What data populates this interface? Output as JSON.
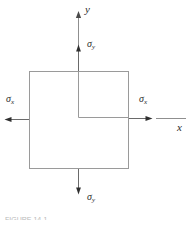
{
  "figure": {
    "kind": "stress-element-diagram",
    "title_caption": "FIGURE 14-1",
    "colors": {
      "element_border": "#9a9a9a",
      "axis_line": "#8f8f8f",
      "arrow": "#4a4a4a",
      "label_text": "#2b2b2b",
      "caption_text": "#b9b9b9",
      "background": "#ffffff"
    },
    "element": {
      "name": "stress-element-square",
      "x": 29,
      "y": 71,
      "width": 99,
      "height": 97
    },
    "origin": {
      "x": 78,
      "y": 117
    }
  },
  "axes": [
    {
      "name": "y-axis",
      "label": "y",
      "label_x": 86,
      "label_y": 6,
      "direction": "up",
      "line": {
        "x1": 78,
        "y1": 117,
        "x2": 78,
        "y2": 14
      },
      "arrow_at": {
        "x": 78,
        "y": 14
      }
    },
    {
      "name": "x-axis",
      "label": "x",
      "label_x": 179,
      "label_y": 126,
      "direction": "right",
      "line": {
        "x1": 78,
        "y1": 117,
        "x2": 180,
        "y2": 117
      },
      "arrow_at": {
        "x": 180,
        "y": 117
      }
    }
  ],
  "stress_arrows": [
    {
      "name": "sigma-y-top",
      "symbol": "σ",
      "subscript": "y",
      "label_x": 88,
      "label_y": 44,
      "direction": "up",
      "line": {
        "x1": 78,
        "y1": 71,
        "x2": 78,
        "y2": 46
      },
      "tip": {
        "x": 78,
        "y": 46
      }
    },
    {
      "name": "sigma-y-bottom",
      "symbol": "σ",
      "subscript": "y",
      "label_x": 88,
      "label_y": 196,
      "direction": "down",
      "line": {
        "x1": 78,
        "y1": 168,
        "x2": 78,
        "y2": 193
      },
      "tip": {
        "x": 78,
        "y": 193
      }
    },
    {
      "name": "sigma-x-left",
      "symbol": "σ",
      "subscript": "x",
      "label_x": 6,
      "label_y": 98,
      "direction": "left",
      "line": {
        "x1": 29,
        "y1": 119,
        "x2": 5,
        "y2": 119
      },
      "tip": {
        "x": 5,
        "y": 119
      }
    },
    {
      "name": "sigma-x-right",
      "symbol": "σ",
      "subscript": "x",
      "label_x": 140,
      "label_y": 98,
      "direction": "right",
      "line": {
        "x1": 128,
        "y1": 119,
        "x2": 152,
        "y2": 119
      },
      "tip": {
        "x": 152,
        "y": 119
      }
    }
  ],
  "interior_axis_marks": {
    "name": "interior-origin-lines",
    "vertical": {
      "x1": 78,
      "y1": 72,
      "x2": 78,
      "y2": 117
    },
    "horizontal": {
      "x1": 78,
      "y1": 117,
      "x2": 128,
      "y2": 117
    }
  },
  "caption": {
    "text": "FIGURE 14-1"
  }
}
